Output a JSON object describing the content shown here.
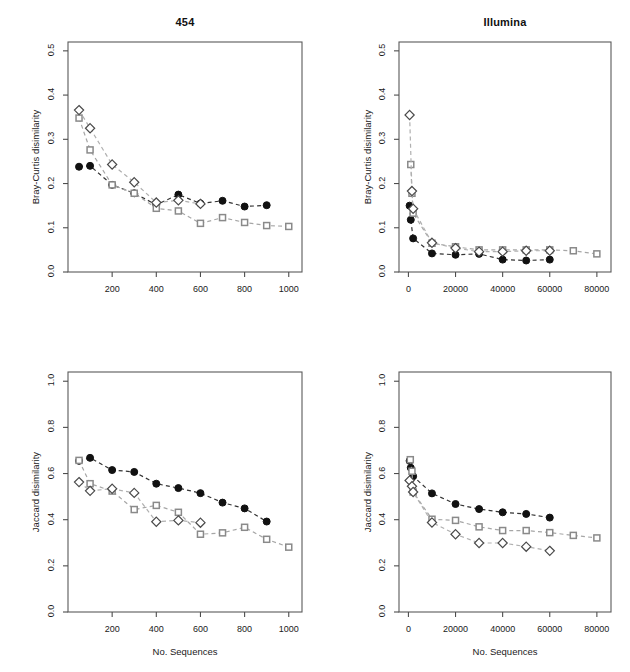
{
  "figure": {
    "width": 630,
    "height": 672,
    "background": "#ffffff",
    "xlabel": "No. Sequences",
    "series_colors": {
      "filled_circle": "#111111",
      "open_square": "#8a8a8a",
      "open_diamond": "#4a4a4a",
      "line_dark": "#333333",
      "line_grey": "#a6a6a6"
    }
  },
  "labels": {
    "xlabel": "No. Sequences",
    "ylabel_top": "Bray-Curtis disimilarity",
    "ylabel_bottom": "Jaccard disimilarity",
    "title_left": "454",
    "title_right": "Illumina"
  },
  "chart_data": [
    {
      "id": "panel-454-bray-curtis",
      "type": "line",
      "title": "454",
      "xlabel": "",
      "ylabel": "Bray-Curtis disimilarity",
      "xlim": [
        0,
        1060
      ],
      "ylim": [
        0.0,
        0.52
      ],
      "xticks": [
        200,
        400,
        600,
        800,
        1000
      ],
      "xticklabels": [
        "200",
        "400",
        "600",
        "800",
        "1000"
      ],
      "yticks": [
        0.0,
        0.1,
        0.2,
        0.3,
        0.4,
        0.5
      ],
      "yticklabels": [
        "0.0",
        "0.1",
        "0.2",
        "0.3",
        "0.4",
        "0.5"
      ],
      "grid": false,
      "legend": "none",
      "series": [
        {
          "name": "filled-circle",
          "marker": "filled-circle",
          "color": "#111111",
          "line_color": "#333333",
          "x": [
            50,
            100,
            200,
            300,
            400,
            500,
            600,
            700,
            800,
            900
          ],
          "values": [
            0.238,
            0.24,
            0.197,
            0.178,
            0.152,
            0.175,
            0.155,
            0.161,
            0.148,
            0.151
          ]
        },
        {
          "name": "open-square",
          "marker": "open-square",
          "color": "#8a8a8a",
          "line_color": "#a6a6a6",
          "x": [
            50,
            100,
            200,
            300,
            400,
            500,
            600,
            700,
            800,
            900,
            1000
          ],
          "values": [
            0.348,
            0.276,
            0.197,
            0.178,
            0.144,
            0.138,
            0.11,
            0.123,
            0.112,
            0.105,
            0.103
          ]
        },
        {
          "name": "open-diamond",
          "marker": "open-diamond",
          "color": "#4a4a4a",
          "line_color": "#b0b0b0",
          "x": [
            50,
            100,
            200,
            300,
            400,
            500,
            600
          ],
          "values": [
            0.366,
            0.325,
            0.243,
            0.203,
            0.157,
            0.162,
            0.154
          ]
        }
      ]
    },
    {
      "id": "panel-illumina-bray-curtis",
      "type": "line",
      "title": "Illumina",
      "xlabel": "",
      "ylabel": "Bray-Curtis disimilarity",
      "xlim": [
        -4000,
        86000
      ],
      "ylim": [
        0.0,
        0.52
      ],
      "xticks": [
        0,
        20000,
        40000,
        60000,
        80000
      ],
      "xticklabels": [
        "0",
        "20000",
        "40000",
        "60000",
        "80000"
      ],
      "yticks": [
        0.0,
        0.1,
        0.2,
        0.3,
        0.4,
        0.5
      ],
      "yticklabels": [
        "0.0",
        "0.1",
        "0.2",
        "0.3",
        "0.4",
        "0.5"
      ],
      "grid": false,
      "legend": "none",
      "series": [
        {
          "name": "filled-circle",
          "marker": "filled-circle",
          "color": "#111111",
          "line_color": "#333333",
          "x": [
            500,
            1000,
            2000,
            10000,
            20000,
            30000,
            40000,
            50000,
            60000
          ],
          "values": [
            0.15,
            0.118,
            0.076,
            0.042,
            0.039,
            0.041,
            0.028,
            0.026,
            0.028
          ]
        },
        {
          "name": "open-square",
          "marker": "open-square",
          "color": "#8a8a8a",
          "line_color": "#a6a6a6",
          "x": [
            1000,
            1500,
            2000,
            10000,
            20000,
            30000,
            40000,
            50000,
            60000,
            70000,
            80000
          ],
          "values": [
            0.243,
            0.178,
            0.133,
            0.065,
            0.057,
            0.05,
            0.05,
            0.05,
            0.05,
            0.048,
            0.041
          ]
        },
        {
          "name": "open-diamond",
          "marker": "open-diamond",
          "color": "#4a4a4a",
          "line_color": "#b0b0b0",
          "x": [
            500,
            1500,
            2000,
            10000,
            20000,
            30000,
            40000,
            50000,
            60000
          ],
          "values": [
            0.355,
            0.183,
            0.143,
            0.066,
            0.054,
            0.046,
            0.046,
            0.048,
            0.048
          ]
        }
      ]
    },
    {
      "id": "panel-454-jaccard",
      "type": "line",
      "title": "",
      "xlabel": "No. Sequences",
      "ylabel": "Jaccard disimilarity",
      "xlim": [
        0,
        1060
      ],
      "ylim": [
        0.0,
        1.04
      ],
      "xticks": [
        200,
        400,
        600,
        800,
        1000
      ],
      "xticklabels": [
        "200",
        "400",
        "600",
        "800",
        "1000"
      ],
      "yticks": [
        0.0,
        0.2,
        0.4,
        0.6,
        0.8,
        1.0
      ],
      "yticklabels": [
        "0.0",
        "0.2",
        "0.4",
        "0.6",
        "0.8",
        "1.0"
      ],
      "grid": false,
      "legend": "none",
      "series": [
        {
          "name": "filled-circle",
          "marker": "filled-circle",
          "color": "#111111",
          "line_color": "#333333",
          "x": [
            50,
            100,
            200,
            300,
            400,
            500,
            600,
            700,
            800,
            900
          ],
          "values": [
            0.655,
            0.668,
            0.615,
            0.607,
            0.556,
            0.537,
            0.515,
            0.474,
            0.449,
            0.392
          ]
        },
        {
          "name": "open-square",
          "marker": "open-square",
          "color": "#8a8a8a",
          "line_color": "#a6a6a6",
          "x": [
            50,
            100,
            200,
            300,
            400,
            500,
            600,
            700,
            800,
            900,
            1000
          ],
          "values": [
            0.657,
            0.556,
            0.524,
            0.444,
            0.462,
            0.432,
            0.337,
            0.343,
            0.367,
            0.315,
            0.281
          ]
        },
        {
          "name": "open-diamond",
          "marker": "open-diamond",
          "color": "#4a4a4a",
          "line_color": "#b0b0b0",
          "x": [
            50,
            100,
            200,
            300,
            400,
            500,
            600
          ],
          "values": [
            0.563,
            0.525,
            0.534,
            0.516,
            0.391,
            0.397,
            0.387
          ]
        }
      ]
    },
    {
      "id": "panel-illumina-jaccard",
      "type": "line",
      "title": "",
      "xlabel": "No. Sequences",
      "ylabel": "Jaccard disimilarity",
      "xlim": [
        -4000,
        86000
      ],
      "ylim": [
        0.0,
        1.04
      ],
      "xticks": [
        0,
        20000,
        40000,
        60000,
        80000
      ],
      "xticklabels": [
        "0",
        "20000",
        "40000",
        "60000",
        "80000"
      ],
      "yticks": [
        0.0,
        0.2,
        0.4,
        0.6,
        0.8,
        1.0
      ],
      "yticklabels": [
        "0.0",
        "0.2",
        "0.4",
        "0.6",
        "0.8",
        "1.0"
      ],
      "grid": false,
      "legend": "none",
      "series": [
        {
          "name": "filled-circle",
          "marker": "filled-circle",
          "color": "#111111",
          "line_color": "#333333",
          "x": [
            500,
            1000,
            2000,
            10000,
            20000,
            30000,
            40000,
            50000,
            60000
          ],
          "values": [
            0.655,
            0.625,
            0.588,
            0.514,
            0.468,
            0.446,
            0.432,
            0.425,
            0.409
          ]
        },
        {
          "name": "open-square",
          "marker": "open-square",
          "color": "#8a8a8a",
          "line_color": "#a6a6a6",
          "x": [
            800,
            1500,
            2000,
            10000,
            20000,
            30000,
            40000,
            50000,
            60000,
            70000,
            80000
          ],
          "values": [
            0.66,
            0.61,
            0.52,
            0.402,
            0.397,
            0.369,
            0.353,
            0.353,
            0.344,
            0.332,
            0.321
          ]
        },
        {
          "name": "open-diamond",
          "marker": "open-diamond",
          "color": "#4a4a4a",
          "line_color": "#b0b0b0",
          "x": [
            500,
            1500,
            2000,
            10000,
            20000,
            30000,
            40000,
            50000,
            60000
          ],
          "values": [
            0.57,
            0.545,
            0.52,
            0.388,
            0.337,
            0.299,
            0.299,
            0.283,
            0.265
          ]
        }
      ]
    }
  ]
}
